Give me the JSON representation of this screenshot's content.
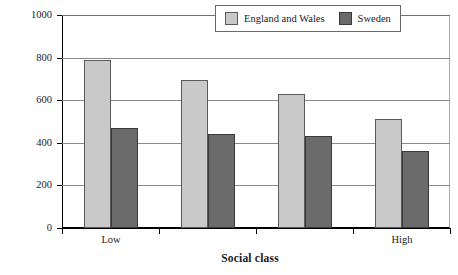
{
  "chart_data": {
    "type": "bar",
    "title": "",
    "xlabel": "Social class",
    "ylabel": "Deaths per 100,000",
    "ylim": [
      0,
      1000
    ],
    "yticks": [
      0,
      200,
      400,
      600,
      800,
      1000
    ],
    "ytick_labels": [
      "0",
      "200",
      "400",
      "600",
      "800",
      "1000"
    ],
    "grid": true,
    "legend_position": "top-right-inside",
    "categories": [
      "Low",
      "",
      "",
      "High"
    ],
    "category_labels_visible": [
      "Low",
      "High"
    ],
    "series": [
      {
        "name": "England and Wales",
        "color": "#c9c9c9",
        "values": [
          790,
          695,
          630,
          510
        ]
      },
      {
        "name": "Sweden",
        "color": "#6b6b6b",
        "values": [
          470,
          440,
          430,
          360
        ]
      }
    ]
  },
  "legend": {
    "entries": [
      {
        "label": "England and Wales"
      },
      {
        "label": "Sweden"
      }
    ]
  },
  "axes": {
    "y_title": "Deaths per 100,000",
    "x_title": "Social class"
  },
  "colors": {
    "series_light": "#c9c9c9",
    "series_dark": "#6b6b6b",
    "axis": "#000000",
    "gridline": "#8a8a8a",
    "background": "#ffffff"
  }
}
